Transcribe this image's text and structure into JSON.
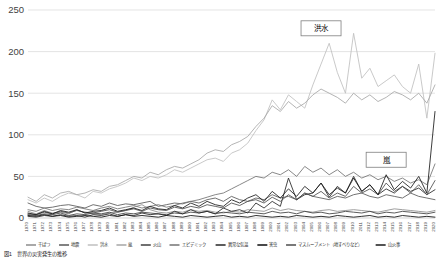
{
  "chart_data": {
    "type": "line",
    "title": "",
    "xlabel": "",
    "ylabel": "",
    "ylim": [
      0,
      250
    ],
    "yticks": [
      0,
      50,
      100,
      150,
      200,
      250
    ],
    "grid": true,
    "legend_position": "bottom",
    "x": [
      1970,
      1971,
      1972,
      1973,
      1974,
      1975,
      1976,
      1977,
      1978,
      1979,
      1980,
      1981,
      1982,
      1983,
      1984,
      1985,
      1986,
      1987,
      1988,
      1989,
      1990,
      1991,
      1992,
      1993,
      1994,
      1995,
      1996,
      1997,
      1998,
      1999,
      2000,
      2001,
      2002,
      2003,
      2004,
      2005,
      2006,
      2007,
      2008,
      2009,
      2010,
      2011,
      2012,
      2013,
      2014,
      2015,
      2016,
      2017,
      2018,
      2019,
      2020
    ],
    "annotations": [
      {
        "label": "洪水",
        "x": 2006,
        "y": 228
      },
      {
        "label": "嵐",
        "x": 2014,
        "y": 70
      }
    ],
    "series": [
      {
        "name": "干ばつ",
        "color": "#8c8c8c",
        "values": [
          8,
          5,
          9,
          6,
          7,
          5,
          10,
          6,
          5,
          4,
          6,
          7,
          9,
          13,
          16,
          10,
          7,
          6,
          8,
          7,
          10,
          8,
          9,
          7,
          6,
          8,
          7,
          10,
          9,
          8,
          12,
          9,
          11,
          9,
          8,
          7,
          9,
          10,
          8,
          9,
          10,
          9,
          8,
          7,
          9,
          11,
          10,
          9,
          8,
          7,
          9
        ]
      },
      {
        "name": "地震",
        "color": "#595959",
        "values": [
          18,
          14,
          12,
          13,
          15,
          16,
          14,
          12,
          16,
          14,
          18,
          15,
          17,
          16,
          18,
          20,
          14,
          16,
          18,
          17,
          20,
          18,
          22,
          24,
          20,
          26,
          22,
          20,
          24,
          22,
          28,
          24,
          26,
          22,
          30,
          26,
          24,
          22,
          26,
          24,
          28,
          30,
          26,
          24,
          28,
          26,
          24,
          30,
          26,
          24,
          22
        ]
      },
      {
        "name": "洪水",
        "color": "#bfbfbf",
        "values": [
          22,
          18,
          24,
          20,
          26,
          30,
          28,
          24,
          32,
          30,
          35,
          38,
          42,
          48,
          45,
          50,
          48,
          52,
          58,
          55,
          60,
          65,
          70,
          72,
          68,
          78,
          82,
          90,
          105,
          118,
          142,
          130,
          148,
          140,
          132,
          160,
          185,
          210,
          175,
          150,
          222,
          168,
          180,
          158,
          165,
          172,
          158,
          150,
          185,
          120,
          198
        ]
      },
      {
        "name": "嵐",
        "color": "#a6a6a6",
        "values": [
          25,
          20,
          28,
          24,
          30,
          32,
          28,
          30,
          34,
          32,
          38,
          40,
          45,
          50,
          48,
          55,
          52,
          58,
          62,
          60,
          65,
          70,
          78,
          82,
          80,
          88,
          92,
          98,
          110,
          120,
          135,
          128,
          140,
          132,
          138,
          148,
          155,
          150,
          145,
          138,
          150,
          142,
          148,
          140,
          145,
          152,
          148,
          142,
          150,
          138,
          160
        ]
      },
      {
        "name": "火山",
        "color": "#404040",
        "values": [
          4,
          3,
          5,
          4,
          6,
          3,
          5,
          4,
          6,
          5,
          7,
          4,
          6,
          5,
          7,
          6,
          5,
          4,
          6,
          5,
          7,
          6,
          8,
          5,
          7,
          6,
          5,
          7,
          6,
          5,
          8,
          6,
          7,
          5,
          8,
          6,
          7,
          5,
          6,
          8,
          7,
          6,
          8,
          5,
          7,
          6,
          8,
          7,
          6,
          5,
          7
        ]
      },
      {
        "name": "エピデミック",
        "color": "#737373",
        "values": [
          10,
          8,
          12,
          9,
          11,
          10,
          13,
          11,
          9,
          12,
          14,
          11,
          13,
          15,
          12,
          14,
          16,
          13,
          15,
          18,
          20,
          22,
          25,
          28,
          30,
          35,
          40,
          45,
          50,
          48,
          55,
          52,
          58,
          50,
          62,
          55,
          60,
          52,
          58,
          50,
          55,
          48,
          52,
          46,
          50,
          44,
          48,
          42,
          46,
          40,
          65
        ]
      },
      {
        "name": "異常な気温",
        "color": "#262626",
        "values": [
          2,
          1,
          3,
          2,
          4,
          2,
          3,
          1,
          4,
          3,
          5,
          2,
          4,
          3,
          6,
          4,
          5,
          3,
          8,
          5,
          10,
          6,
          8,
          5,
          12,
          8,
          10,
          6,
          18,
          12,
          20,
          14,
          48,
          22,
          28,
          30,
          42,
          25,
          38,
          30,
          50,
          32,
          40,
          28,
          35,
          30,
          38,
          32,
          36,
          28,
          34
        ]
      },
      {
        "name": "害虫",
        "color": "#0d0d0d",
        "values": [
          3,
          2,
          4,
          2,
          3,
          1,
          2,
          3,
          2,
          1,
          3,
          2,
          4,
          2,
          3,
          2,
          1,
          3,
          2,
          1,
          3,
          2,
          1,
          2,
          3,
          1,
          2,
          1,
          3,
          2,
          1,
          2,
          1,
          3,
          2,
          1,
          2,
          1,
          3,
          2,
          1,
          2,
          3,
          1,
          2,
          1,
          3,
          2,
          1,
          2,
          1
        ]
      },
      {
        "name": "マスムーブメント（地すべりなど）",
        "color": "#4d4d4d",
        "values": [
          5,
          4,
          7,
          5,
          8,
          6,
          9,
          7,
          6,
          8,
          10,
          7,
          9,
          11,
          8,
          12,
          10,
          9,
          13,
          11,
          14,
          12,
          16,
          14,
          12,
          18,
          15,
          20,
          22,
          18,
          25,
          20,
          28,
          22,
          30,
          26,
          32,
          24,
          30,
          26,
          38,
          30,
          35,
          28,
          42,
          32,
          38,
          30,
          40,
          28,
          45
        ]
      },
      {
        "name": "山火事",
        "color": "#1a1a1a",
        "values": [
          6,
          4,
          8,
          5,
          9,
          7,
          10,
          6,
          8,
          9,
          12,
          8,
          10,
          12,
          9,
          14,
          11,
          10,
          15,
          12,
          18,
          14,
          20,
          16,
          14,
          22,
          18,
          24,
          28,
          20,
          32,
          24,
          35,
          26,
          38,
          30,
          42,
          28,
          36,
          30,
          48,
          32,
          40,
          28,
          52,
          34,
          44,
          36,
          50,
          30,
          128
        ]
      }
    ]
  },
  "legend": {
    "items": [
      {
        "label": "干ばつ"
      },
      {
        "label": "地震"
      },
      {
        "label": "洪水"
      },
      {
        "label": "嵐"
      },
      {
        "label": "火山"
      },
      {
        "label": "エピデミック"
      },
      {
        "label": "異常な気温"
      },
      {
        "label": "害虫"
      },
      {
        "label": "マスムーブメント（地すべりなど）"
      },
      {
        "label": "山火事"
      }
    ]
  },
  "caption": {
    "text": "図1　世界の災害発生の推移"
  }
}
